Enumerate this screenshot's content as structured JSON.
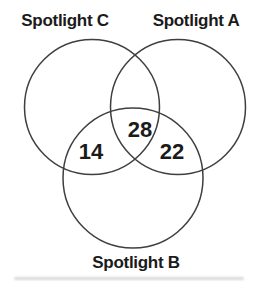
{
  "figure": {
    "type": "venn",
    "colors": {
      "circle_stroke": "#3f3f3f",
      "text": "#1b1b1b",
      "background": "#ffffff"
    },
    "sets": [
      {
        "id": "C",
        "label": "Spotlight C"
      },
      {
        "id": "A",
        "label": "Spotlight A"
      },
      {
        "id": "B",
        "label": "Spotlight B"
      }
    ],
    "regions": [
      {
        "sets": "C and B only",
        "value": "14"
      },
      {
        "sets": "A and B and C",
        "value": "28"
      },
      {
        "sets": "A and B only",
        "value": "22"
      }
    ]
  }
}
